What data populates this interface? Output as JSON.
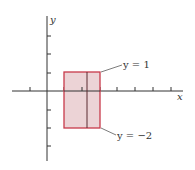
{
  "figure": {
    "axes": {
      "x_label": "x",
      "y_label": "y",
      "x_ticks_count": 8,
      "y_ticks_count": 6
    },
    "region": {
      "x_range": [
        1,
        3
      ],
      "y_range": [
        -2,
        1
      ],
      "fill": "#ecd3d6",
      "stroke": "#c8394a",
      "inner_line_color": "#5a2a30"
    },
    "annotations": [
      {
        "text": "y = 1"
      },
      {
        "text": "y = −2"
      }
    ]
  }
}
